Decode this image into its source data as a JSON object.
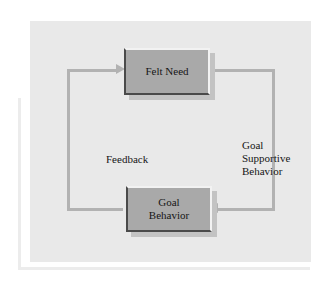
{
  "diagram": {
    "type": "flowchart-cycle",
    "nodes": [
      {
        "id": "felt-need",
        "label": "Felt Need"
      },
      {
        "id": "goal-behavior",
        "label": "Goal\nBehavior"
      }
    ],
    "edge_labels": [
      {
        "id": "feedback",
        "label": "Feedback"
      },
      {
        "id": "goal-supportive-behavior",
        "label": "Goal\nSupportive\nBehavior"
      }
    ],
    "arrows": [
      {
        "id": "arrow-into-felt-need",
        "direction": "right",
        "target": "felt-need"
      },
      {
        "id": "arrow-into-goal-behavior",
        "direction": "left",
        "target": "goal-behavior"
      }
    ],
    "colors": {
      "panel_background": "#e9e9e9",
      "node_fill": "#a9a9a9",
      "node_highlight": "#f2f2f2",
      "node_shade": "#4a4a4a",
      "connector": "#b2b2b2",
      "text": "#161616",
      "page_background": "#ffffff"
    }
  }
}
